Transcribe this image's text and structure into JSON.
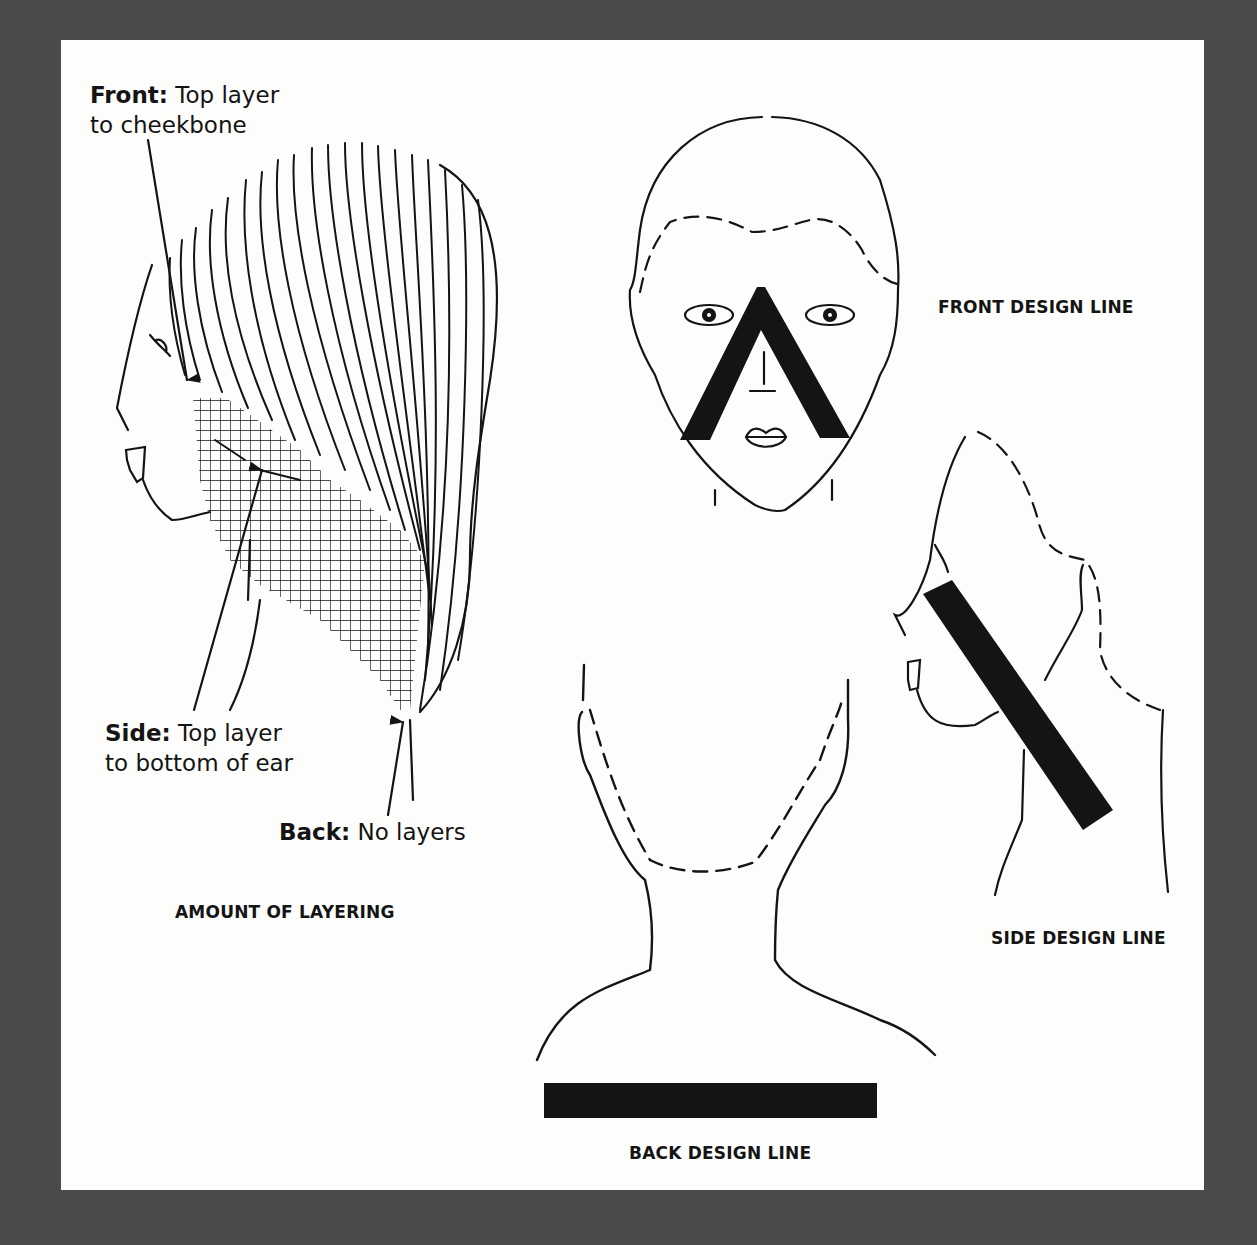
{
  "figure": {
    "background_color": "#4b4b4b",
    "page_color": "#fdfdfc",
    "ink_color": "#141414"
  },
  "amount_of_layering": {
    "caption": "AMOUNT OF LAYERING",
    "callouts": {
      "front": {
        "term": "Front:",
        "line1": "Top layer",
        "line2": "to cheekbone"
      },
      "side": {
        "term": "Side:",
        "line1": "Top layer",
        "line2": "to bottom of ear"
      },
      "back": {
        "term": "Back:",
        "line1": "No layers"
      }
    }
  },
  "design_lines": {
    "front": {
      "caption": "FRONT DESIGN LINE",
      "shape": "inverted-v"
    },
    "side": {
      "caption": "SIDE DESIGN LINE",
      "shape": "diagonal-bar"
    },
    "back": {
      "caption": "BACK DESIGN LINE",
      "shape": "horizontal-bar"
    }
  }
}
